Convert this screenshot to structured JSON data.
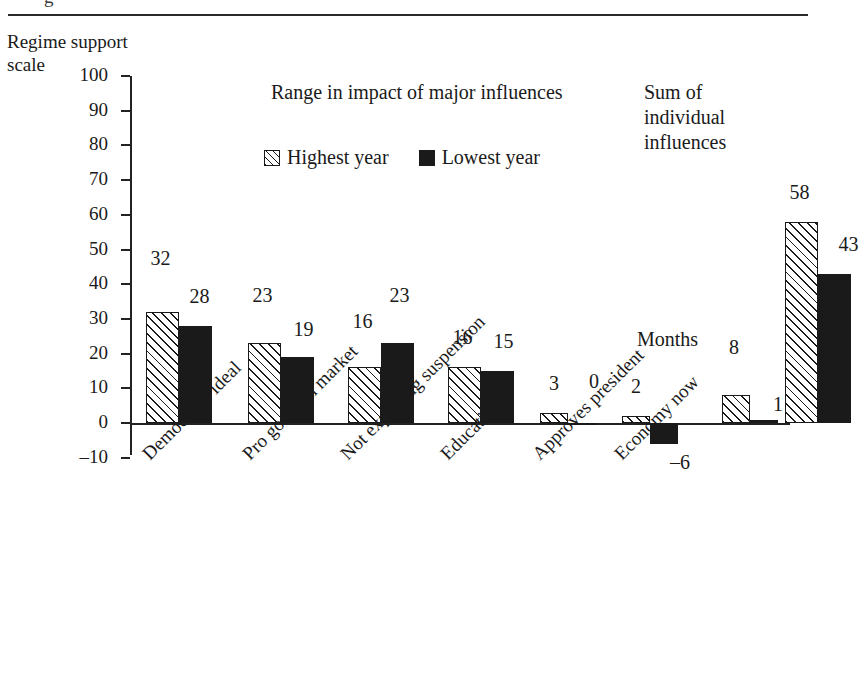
{
  "figure": {
    "cut_caption_glyph": "g",
    "y_axis_title": "Regime support\nscale",
    "range_title": "Range in impact of major influences",
    "sum_title": "Sum of\nindividual\ninfluences",
    "months_label": "Months"
  },
  "legend": {
    "position": "top-center",
    "items": [
      {
        "label": "Highest year",
        "swatch": "hatched-square-icon",
        "color": "#1a1a1a"
      },
      {
        "label": "Lowest year",
        "swatch": "filled-square-icon",
        "color": "#1a1a1a"
      }
    ]
  },
  "chart_data": {
    "type": "bar",
    "title": "Range in impact of major influences",
    "xlabel": "",
    "ylabel": "Regime support scale",
    "ylim": [
      -10,
      100
    ],
    "yticks": [
      -10,
      0,
      10,
      20,
      30,
      40,
      50,
      60,
      70,
      80,
      90,
      100
    ],
    "ytick_labels": [
      "–10",
      "0",
      "10",
      "20",
      "30",
      "40",
      "50",
      "60",
      "70",
      "80",
      "90",
      "100"
    ],
    "grid": false,
    "categories": [
      "Democratic ideal",
      "Pro goods in market",
      "Not expecting suspension",
      "Education",
      "Approves president",
      "Economy now",
      "Months",
      "Sum of individual influences"
    ],
    "series": [
      {
        "name": "Highest year",
        "values": [
          32,
          23,
          16,
          16,
          3,
          2,
          8,
          58
        ]
      },
      {
        "name": "Lowest year",
        "values": [
          28,
          19,
          23,
          15,
          0,
          -6,
          1,
          43
        ]
      }
    ],
    "value_labels": {
      "highest": [
        "32",
        "23",
        "16",
        "16",
        "3",
        "2",
        "8",
        "58"
      ],
      "lowest": [
        "28",
        "19",
        "23",
        "15",
        "0",
        "–6",
        "1",
        "43"
      ]
    }
  }
}
